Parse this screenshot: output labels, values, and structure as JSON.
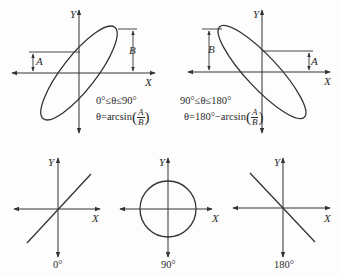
{
  "figure": {
    "panels": [
      {
        "id": "ellipse-0-90",
        "x_axis_label": "X",
        "y_axis_label": "Y",
        "offset_label_a": "A",
        "amplitude_label_b": "B",
        "range_text": "0°≤θ≤90°",
        "formula_prefix": "θ=arcsin",
        "formula_num": "A",
        "formula_den": "B"
      },
      {
        "id": "ellipse-90-180",
        "x_axis_label": "X",
        "y_axis_label": "Y",
        "offset_label_a": "A",
        "amplitude_label_b": "B",
        "range_text": "90°≤θ≤180°",
        "formula_prefix": "θ=180°−arcsin",
        "formula_num": "A",
        "formula_den": "B"
      },
      {
        "id": "line-0",
        "x_axis_label": "X",
        "y_axis_label": "Y",
        "phase_label": "0°"
      },
      {
        "id": "circle-90",
        "x_axis_label": "X",
        "y_axis_label": "Y",
        "phase_label": "90°"
      },
      {
        "id": "line-180",
        "x_axis_label": "X",
        "y_axis_label": "Y",
        "phase_label": "180°"
      }
    ]
  },
  "colors": {
    "ink": "#333333",
    "background": "#fdfdfd"
  }
}
